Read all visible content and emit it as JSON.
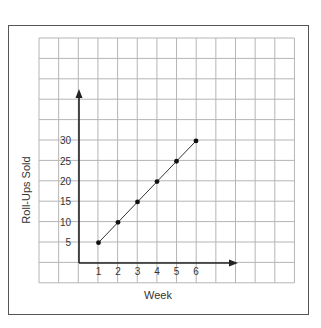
{
  "chart_data": {
    "type": "line",
    "title": "",
    "xlabel": "Week",
    "ylabel": "Roll-Ups Sold",
    "x": [
      1,
      2,
      3,
      4,
      5,
      6
    ],
    "values": [
      5,
      10,
      15,
      20,
      25,
      30
    ],
    "series": [
      {
        "name": "Roll-Ups Sold",
        "x": [
          1,
          2,
          3,
          4,
          5,
          6
        ],
        "values": [
          5,
          10,
          15,
          20,
          25,
          30
        ]
      }
    ],
    "x_tick_labels": [
      "1",
      "2",
      "3",
      "4",
      "5",
      "6"
    ],
    "y_tick_labels": [
      "5",
      "10",
      "15",
      "20",
      "25",
      "30"
    ],
    "y_tick_values": [
      5,
      10,
      15,
      20,
      25,
      30
    ],
    "xlim": [
      0,
      7
    ],
    "ylim": [
      0,
      35
    ],
    "grid": true,
    "markers": true,
    "legend": null
  },
  "colors": {
    "grid": "#b5b5b5",
    "axis": "#222222",
    "line": "#333333",
    "point": "#111111",
    "frame": "#555555",
    "text": "#333333"
  },
  "layout": {
    "grid": {
      "left": 39,
      "top": 38,
      "cols": 13,
      "rows": 12,
      "cell_w": 19.65,
      "cell_h": 20.4
    },
    "origin": {
      "x": 79,
      "y": 263
    },
    "x_unit_px": 19.5,
    "y_unit_px": 4.07,
    "x_axis_end": 238,
    "y_axis_end": 89
  }
}
